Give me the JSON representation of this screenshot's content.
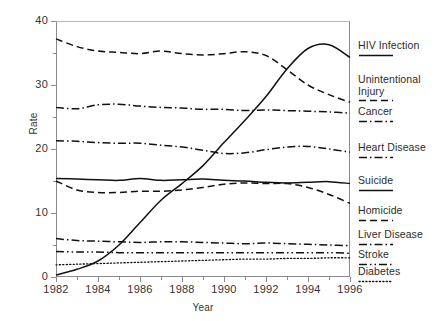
{
  "chart_data": {
    "type": "line",
    "title": "",
    "xlabel": "Year",
    "ylabel": "Rate",
    "xlim": [
      1982,
      1996
    ],
    "ylim": [
      0,
      40
    ],
    "yticks": [
      0,
      10,
      20,
      30,
      40
    ],
    "yminor_step": 5,
    "xticks": [
      1982,
      1984,
      1986,
      1988,
      1990,
      1992,
      1994,
      1996
    ],
    "xminor_step": 1,
    "grid": false,
    "legend_position": "right-outside",
    "x": [
      1982,
      1983,
      1984,
      1985,
      1986,
      1987,
      1988,
      1989,
      1990,
      1991,
      1992,
      1993,
      1994,
      1995,
      1996
    ],
    "series": [
      {
        "name": "HIV Infection",
        "style": "solid",
        "values": [
          0.3,
          1.2,
          2.5,
          5.0,
          8.5,
          12.0,
          14.6,
          17.4,
          21.0,
          24.5,
          28.2,
          32.5,
          35.7,
          36.3,
          34.3
        ]
      },
      {
        "name": "Unintentional Injury",
        "style": "dashed",
        "values": [
          37.2,
          36.0,
          35.3,
          35.1,
          34.9,
          35.3,
          34.9,
          34.7,
          34.9,
          35.2,
          34.6,
          32.4,
          30.0,
          28.5,
          27.3
        ]
      },
      {
        "name": "Cancer",
        "style": "dashdot",
        "values": [
          26.5,
          26.3,
          26.9,
          27.0,
          26.7,
          26.5,
          26.4,
          26.2,
          26.2,
          26.0,
          26.1,
          26.0,
          25.9,
          25.8,
          25.6
        ]
      },
      {
        "name": "Heart Disease",
        "style": "dashdot",
        "values": [
          21.3,
          21.2,
          21.0,
          20.9,
          20.9,
          20.6,
          20.3,
          19.8,
          19.3,
          19.4,
          19.9,
          20.3,
          20.4,
          20.0,
          19.5
        ]
      },
      {
        "name": "Suicide",
        "style": "solid",
        "values": [
          15.4,
          15.3,
          15.2,
          15.1,
          15.4,
          15.1,
          15.2,
          15.3,
          15.1,
          15.0,
          14.8,
          14.7,
          14.8,
          14.9,
          14.6
        ]
      },
      {
        "name": "Homicide",
        "style": "dashed",
        "values": [
          15.0,
          13.6,
          13.2,
          13.2,
          13.4,
          13.4,
          13.6,
          14.0,
          14.5,
          14.7,
          14.6,
          14.6,
          14.0,
          12.9,
          11.5
        ]
      },
      {
        "name": "Liver Disease",
        "style": "dashdot",
        "values": [
          6.0,
          5.7,
          5.6,
          5.5,
          5.4,
          5.5,
          5.5,
          5.4,
          5.3,
          5.2,
          5.3,
          5.2,
          5.1,
          5.0,
          4.9
        ]
      },
      {
        "name": "Stroke",
        "style": "dashdotdot",
        "values": [
          4.0,
          3.9,
          3.9,
          3.8,
          3.8,
          3.8,
          3.8,
          3.8,
          3.8,
          3.8,
          3.8,
          3.8,
          3.8,
          3.8,
          3.7
        ]
      },
      {
        "name": "Diabetes",
        "style": "dotted",
        "values": [
          1.9,
          2.0,
          2.1,
          2.2,
          2.3,
          2.4,
          2.5,
          2.6,
          2.7,
          2.8,
          2.8,
          2.9,
          2.9,
          3.0,
          3.0
        ]
      }
    ]
  },
  "axes": {
    "ylabel": "Rate",
    "xlabel": "Year",
    "ytick_labels": [
      "0",
      "10",
      "20",
      "30",
      "40"
    ],
    "xtick_labels": [
      "1982",
      "1984",
      "1986",
      "1988",
      "1990",
      "1992",
      "1994",
      "1996"
    ]
  },
  "legend": {
    "items": [
      {
        "label": "HIV Infection",
        "style": "solid"
      },
      {
        "label": "Unintentional",
        "label2": "Injury",
        "style": "dashed"
      },
      {
        "label": "Cancer",
        "style": "dashdot"
      },
      {
        "label": "Heart Disease",
        "style": "dashdot"
      },
      {
        "label": "Suicide",
        "style": "solid"
      },
      {
        "label": "Homicide",
        "style": "dashed"
      },
      {
        "label": "Liver Disease",
        "style": "dashdot"
      },
      {
        "label": "Stroke",
        "style": "dashdotdot"
      },
      {
        "label": "Diabetes",
        "style": "dotted"
      }
    ]
  },
  "colors": {
    "line": "#111111",
    "axis": "#8a8a8a",
    "text": "#2b2b2b"
  }
}
